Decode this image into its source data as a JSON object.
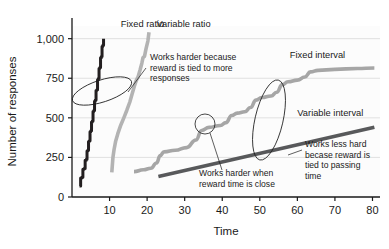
{
  "chart_data": {
    "type": "line",
    "title": "",
    "xlabel": "Time",
    "ylabel": "Number of responses",
    "xlim": [
      0,
      82
    ],
    "ylim": [
      0,
      1080
    ],
    "xticks": [
      10,
      20,
      30,
      40,
      50,
      60,
      70,
      80
    ],
    "xticklabels": [
      "10",
      "20",
      "30",
      "40",
      "50",
      "60",
      "70",
      "80"
    ],
    "yticks": [
      0,
      250,
      500,
      750,
      1000
    ],
    "yticklabels": [
      "0",
      "250",
      "500",
      "750",
      "1,000"
    ],
    "grid": "horizontal",
    "legend_position": "inline-labels",
    "series": [
      {
        "name": "Fixed ratio",
        "color": "#231f20",
        "style": "stepped-steep",
        "label_x": 13,
        "label_y": 1075,
        "points": [
          [
            2.0,
            70
          ],
          [
            2.3,
            120
          ],
          [
            2.6,
            125
          ],
          [
            2.9,
            175
          ],
          [
            3.2,
            180
          ],
          [
            3.5,
            232
          ],
          [
            3.8,
            238
          ],
          [
            4.0,
            290
          ],
          [
            4.2,
            296
          ],
          [
            4.4,
            350
          ],
          [
            4.6,
            356
          ],
          [
            4.8,
            412
          ],
          [
            5.0,
            418
          ],
          [
            5.2,
            474
          ],
          [
            5.4,
            480
          ],
          [
            5.6,
            540
          ],
          [
            5.8,
            546
          ],
          [
            6.0,
            605
          ],
          [
            6.2,
            612
          ],
          [
            6.4,
            672
          ],
          [
            6.6,
            678
          ],
          [
            6.8,
            740
          ],
          [
            7.0,
            748
          ],
          [
            7.2,
            812
          ],
          [
            7.4,
            818
          ],
          [
            7.6,
            880
          ],
          [
            7.8,
            888
          ],
          [
            8.0,
            950
          ],
          [
            8.2,
            958
          ],
          [
            8.4,
            1000
          ]
        ]
      },
      {
        "name": "Variable ratio",
        "color": "#b3b3b3",
        "style": "near-linear-steep",
        "label_x": 22.5,
        "label_y": 1075,
        "points": [
          [
            10.6,
            155
          ],
          [
            10.9,
            250
          ],
          [
            11.2,
            300
          ],
          [
            11.6,
            350
          ],
          [
            12.2,
            400
          ],
          [
            13.0,
            455
          ],
          [
            13.8,
            500
          ],
          [
            14.6,
            548
          ],
          [
            15.4,
            600
          ],
          [
            16.0,
            650
          ],
          [
            16.6,
            700
          ],
          [
            17.1,
            735
          ],
          [
            17.6,
            760
          ],
          [
            18.1,
            800
          ],
          [
            18.6,
            845
          ],
          [
            18.9,
            880
          ],
          [
            19.3,
            888
          ],
          [
            19.7,
            935
          ],
          [
            20.2,
            985
          ],
          [
            20.5,
            1040
          ]
        ]
      },
      {
        "name": "Fixed interval",
        "color": "#a6a6a6",
        "style": "scalloped",
        "label_x": 58,
        "label_y": 880,
        "points": [
          [
            16.5,
            160
          ],
          [
            19.0,
            172
          ],
          [
            21.0,
            182
          ],
          [
            22.5,
            215
          ],
          [
            23.5,
            262
          ],
          [
            24.5,
            285
          ],
          [
            27.5,
            295
          ],
          [
            30.5,
            312
          ],
          [
            33.0,
            360
          ],
          [
            34.5,
            420
          ],
          [
            36.5,
            440
          ],
          [
            39.5,
            452
          ],
          [
            41.0,
            470
          ],
          [
            42.5,
            515
          ],
          [
            44.0,
            530
          ],
          [
            46.0,
            538
          ],
          [
            47.5,
            565
          ],
          [
            49.0,
            612
          ],
          [
            50.5,
            628
          ],
          [
            53.0,
            638
          ],
          [
            54.5,
            662
          ],
          [
            56.0,
            710
          ],
          [
            57.5,
            728
          ],
          [
            60.0,
            738
          ],
          [
            62.0,
            758
          ],
          [
            63.5,
            790
          ],
          [
            65.5,
            800
          ],
          [
            70.0,
            806
          ],
          [
            76.0,
            812
          ],
          [
            80.5,
            815
          ]
        ]
      },
      {
        "name": "Variable interval",
        "color": "#58595b",
        "style": "linear-shallow",
        "label_x": 60,
        "label_y": 510,
        "points": [
          [
            23.0,
            130
          ],
          [
            80.5,
            440
          ]
        ]
      }
    ],
    "annotations": [
      {
        "id": "ratio-note",
        "text": [
          "Works harder because",
          "reward is tied to more",
          "responses"
        ],
        "text_x": 150,
        "text_y": 60,
        "ellipse": {
          "cx": 102,
          "cy": 91,
          "rx": 31,
          "ry": 11,
          "rotate": -18
        },
        "leader": [
          [
            146,
            68
          ],
          [
            128,
            92
          ]
        ]
      },
      {
        "id": "fi-scallop-note",
        "text": [
          "Works harder when",
          "reward time is close"
        ],
        "text_x": 199,
        "text_y": 176,
        "ellipse": {
          "cx": 205,
          "cy": 124,
          "rx": 10,
          "ry": 10,
          "rotate": 0
        },
        "leader": [
          [
            210,
            133
          ],
          [
            222,
            170
          ]
        ]
      },
      {
        "id": "vi-note",
        "text": [
          "Works less hard",
          "becase reward is",
          "tied to passing",
          "time"
        ],
        "text_x": 305,
        "text_y": 147,
        "ellipse": {
          "cx": 269,
          "cy": 120,
          "rx": 14,
          "ry": 41,
          "rotate": 13
        },
        "leader": [
          [
            288,
            155
          ],
          [
            302,
            150
          ]
        ]
      }
    ]
  }
}
